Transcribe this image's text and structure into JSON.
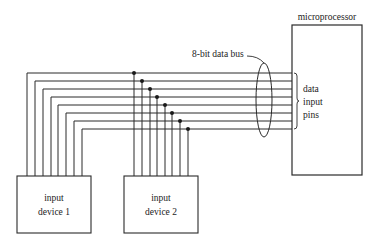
{
  "diagram": {
    "type": "block-diagram",
    "microprocessor": {
      "label": "microprocessor",
      "box": [
        292,
        25,
        70,
        150
      ]
    },
    "bus": {
      "label": "8-bit data bus",
      "bits": 8,
      "line_ys": [
        73,
        81,
        89,
        97,
        105,
        113,
        121,
        129
      ],
      "end_x": 292
    },
    "pins_label": [
      "data",
      "input",
      "pins"
    ],
    "devices": [
      {
        "id": "device1",
        "label_lines": [
          "input",
          "device 1"
        ],
        "box": [
          17,
          176,
          74,
          57
        ],
        "wire_xs": [
          27,
          35,
          43,
          51,
          58,
          66,
          74,
          82
        ]
      },
      {
        "id": "device2",
        "label_lines": [
          "input",
          "device 2"
        ],
        "box": [
          124,
          176,
          74,
          57
        ],
        "wire_xs": [
          134,
          142,
          150,
          157,
          165,
          172,
          180,
          188
        ]
      }
    ],
    "colors": {
      "line": "#2a2a2a",
      "background": "#ffffff"
    }
  }
}
